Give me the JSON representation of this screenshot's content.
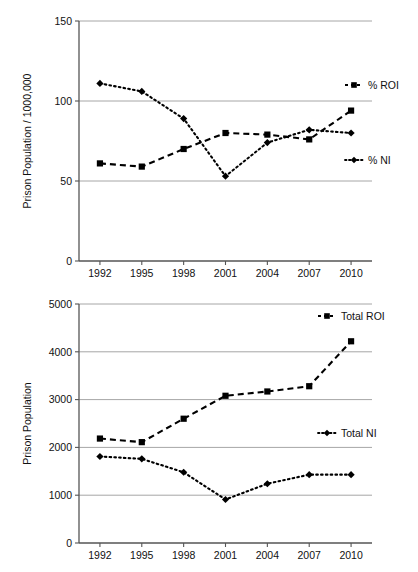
{
  "figure": {
    "background_color": "#ffffff",
    "line_color": "#000000",
    "grid_color": "#a6a6a6",
    "axis_color": "#555555"
  },
  "chart_data": [
    {
      "id": "prison-rate-chart",
      "type": "line",
      "title": "",
      "xlabel": "",
      "ylabel": "Prison Population / 1000,000",
      "categories": [
        "1992",
        "1995",
        "1998",
        "2001",
        "2004",
        "2007",
        "2010"
      ],
      "x": [
        1992,
        1995,
        1998,
        2001,
        2004,
        2007,
        2010
      ],
      "ylim": [
        0,
        150
      ],
      "yticks": [
        0,
        50,
        100,
        150
      ],
      "ytick_labels": [
        "0",
        "50",
        "100",
        "150"
      ],
      "grid": "horizontal",
      "legend_position": "right",
      "series": [
        {
          "name": "% ROI",
          "marker": "square",
          "line_style": "dashed",
          "values": [
            61,
            59,
            70,
            80,
            79,
            76,
            94
          ]
        },
        {
          "name": "% NI",
          "marker": "diamond",
          "line_style": "dotted",
          "values": [
            111,
            106,
            89,
            53,
            74,
            82,
            80
          ]
        }
      ]
    },
    {
      "id": "prison-total-chart",
      "type": "line",
      "title": "",
      "xlabel": "",
      "ylabel": "Prison Population",
      "categories": [
        "1992",
        "1995",
        "1998",
        "2001",
        "2004",
        "2007",
        "2010"
      ],
      "x": [
        1992,
        1995,
        1998,
        2001,
        2004,
        2007,
        2010
      ],
      "ylim": [
        0,
        5000
      ],
      "yticks": [
        0,
        1000,
        2000,
        3000,
        4000,
        5000
      ],
      "ytick_labels": [
        "0",
        "1000",
        "2000",
        "3000",
        "4000",
        "5000"
      ],
      "grid": "horizontal",
      "legend_position": "right",
      "series": [
        {
          "name": "Total ROI",
          "marker": "square",
          "line_style": "dashed",
          "values": [
            2185,
            2110,
            2600,
            3080,
            3170,
            3280,
            4220
          ]
        },
        {
          "name": "Total NI",
          "marker": "diamond",
          "line_style": "dotted",
          "values": [
            1810,
            1760,
            1480,
            910,
            1240,
            1430,
            1430
          ]
        }
      ]
    }
  ]
}
